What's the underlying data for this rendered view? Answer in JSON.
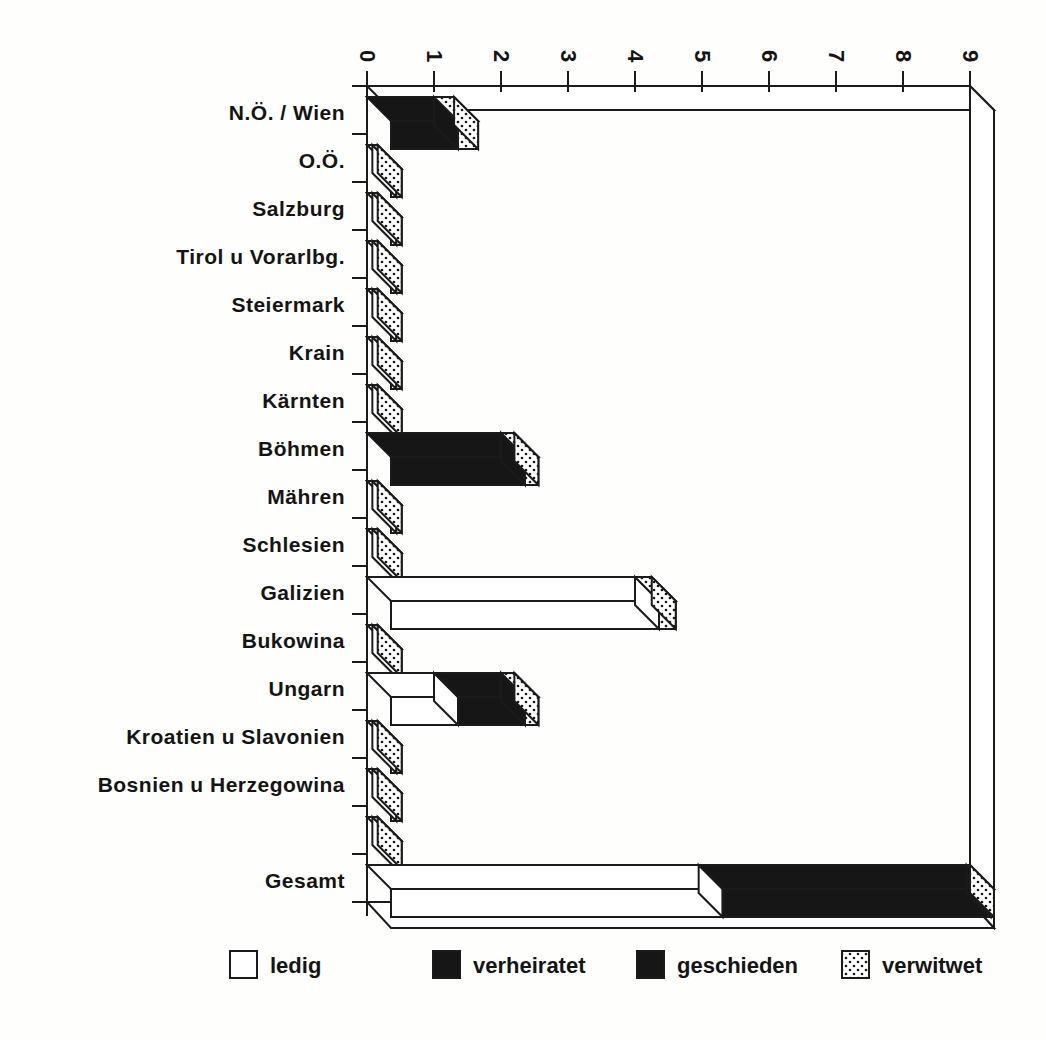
{
  "page": {
    "background": "#fefefd",
    "ink_color": "#1b1b1b"
  },
  "chart_data": {
    "type": "bar",
    "subtype": "horizontal-stacked-3d",
    "title": "",
    "xlabel": "",
    "ylabel": "",
    "value_axis": {
      "min": 0,
      "max": 9,
      "tick_labels": [
        "0",
        "1",
        "2",
        "3",
        "4",
        "5",
        "6",
        "7",
        "8",
        "9"
      ],
      "tick_step": 1,
      "position": "top",
      "labels_rotated": true
    },
    "categories": [
      "N.Ö. / Wien",
      "O.Ö.",
      "Salzburg",
      "Tirol u Vorarlbg.",
      "Steiermark",
      "Krain",
      "Kärnten",
      "Böhmen",
      "Mähren",
      "Schlesien",
      "Galizien",
      "Bukowina",
      "Ungarn",
      "Kroatien u Slavonien",
      "Bosnien u Herzegowina",
      "",
      "Gesamt"
    ],
    "series": [
      {
        "name": "ledig",
        "fill": "#ffffff",
        "pattern": "solid",
        "values": [
          0,
          0.08,
          0.08,
          0.08,
          0.08,
          0.08,
          0.08,
          0,
          0.08,
          0.08,
          4.0,
          0.08,
          1.0,
          0.08,
          0.08,
          0.08,
          4.95
        ]
      },
      {
        "name": "verheiratet",
        "fill": "#161616",
        "pattern": "solid",
        "values": [
          1.0,
          0,
          0,
          0,
          0,
          0,
          0,
          2.0,
          0,
          0,
          0,
          0,
          1.0,
          0,
          0,
          0,
          4.0
        ]
      },
      {
        "name": "geschieden",
        "fill": "#1c1c1c",
        "pattern": "solid",
        "values": [
          0,
          0,
          0,
          0,
          0,
          0,
          0,
          0,
          0,
          0,
          0,
          0,
          0,
          0,
          0,
          0,
          0
        ]
      },
      {
        "name": "verwitwet",
        "fill": "pattern-dots",
        "pattern": "dots",
        "values": [
          0.3,
          0.08,
          0.08,
          0.08,
          0.08,
          0.08,
          0.08,
          0.2,
          0.08,
          0.08,
          0.25,
          0.08,
          0.2,
          0.08,
          0.08,
          0.08,
          0.05
        ]
      }
    ],
    "legend": {
      "position": "bottom",
      "items": [
        {
          "label": "ledig",
          "swatch": "white"
        },
        {
          "label": "verheiratet",
          "swatch": "black"
        },
        {
          "label": "geschieden",
          "swatch": "black"
        },
        {
          "label": "verwitwet",
          "swatch": "dots"
        }
      ]
    },
    "grid": false
  }
}
